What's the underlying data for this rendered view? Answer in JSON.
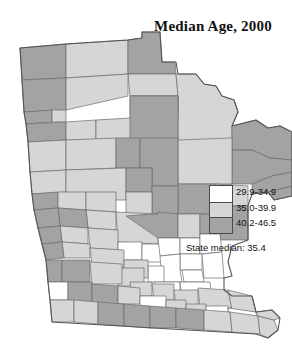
{
  "title": "Median Age, 2000",
  "legend": {
    "classes": [
      {
        "label": "29.9-34.9",
        "color": "#ffffff"
      },
      {
        "label": "35.0-39.9",
        "color": "#d6d6d6"
      },
      {
        "label": "40.2-46.5",
        "color": "#a3a3a3"
      }
    ],
    "state_median": "State median: 35.4"
  },
  "map": {
    "region": "Minnesota",
    "stroke": "#6b6b6b",
    "outline_stroke": "#555555",
    "counties": [
      {
        "name": "kittson",
        "cls": 2,
        "d": "M20,48 L66,44 L66,78 L22,80 Z"
      },
      {
        "name": "roseau",
        "cls": 1,
        "d": "M66,44 L128,40 L128,74 L66,78 Z"
      },
      {
        "name": "lake-of-the-woods",
        "cls": 2,
        "d": "M128,40 L142,38 L142,32 L160,32 L162,62 L175,62 L176,74 L128,74 Z"
      },
      {
        "name": "marshall",
        "cls": 2,
        "d": "M22,80 L66,78 L66,110 L24,112 Z"
      },
      {
        "name": "beltrami-north",
        "cls": 1,
        "d": "M128,74 L176,74 L178,96 L130,96 Z"
      },
      {
        "name": "pennington",
        "cls": 2,
        "d": "M24,112 L52,110 L52,122 L26,124 Z"
      },
      {
        "name": "red-lake",
        "cls": 1,
        "d": "M52,110 L66,110 L66,122 L52,122 Z"
      },
      {
        "name": "polk",
        "cls": 1,
        "d": "M66,78 L128,74 L128,96 L66,110 Z"
      },
      {
        "name": "koochiching",
        "cls": 1,
        "d": "M176,74 L196,74 L204,84 L216,86 L222,96 L234,100 L238,112 L232,126 L232,184 L178,184 L178,96 Z"
      },
      {
        "name": "st-louis-upper",
        "cls": 2,
        "d": "M232,126 L256,120 L268,128 L280,126 L292,132 L292,160 L270,158 L252,150 L232,150 Z"
      },
      {
        "name": "st-louis-lower",
        "cls": 2,
        "d": "M232,150 L252,150 L270,158 L292,160 L292,172 L272,176 L252,184 L232,184 Z"
      },
      {
        "name": "lake-county",
        "cls": 2,
        "d": "M252,184 L272,176 L292,172 L292,186 L268,192 L252,194 Z"
      },
      {
        "name": "cook-county",
        "cls": 2,
        "d": "M268,192 L292,186 L292,196 L274,200 Z"
      },
      {
        "name": "norman",
        "cls": 2,
        "d": "M26,124 L66,122 L66,140 L28,142 Z"
      },
      {
        "name": "mahnomen",
        "cls": 1,
        "d": "M66,122 L96,120 L96,140 L66,140 Z"
      },
      {
        "name": "clearwater",
        "cls": 1,
        "d": "M96,120 L130,118 L130,96 L178,96 L178,118 L130,140 L96,140 Z"
      },
      {
        "name": "beltrami-south",
        "cls": 2,
        "d": "M130,96 L178,96 L178,140 L130,140 Z"
      },
      {
        "name": "itasca",
        "cls": 1,
        "d": "M178,140 L232,138 L232,184 L178,184 Z"
      },
      {
        "name": "clay",
        "cls": 1,
        "d": "M28,142 L66,140 L66,170 L30,172 Z"
      },
      {
        "name": "becker",
        "cls": 1,
        "d": "M66,140 L116,138 L116,168 L66,170 Z"
      },
      {
        "name": "hubbard",
        "cls": 2,
        "d": "M116,138 L140,138 L140,168 L116,168 Z"
      },
      {
        "name": "cass",
        "cls": 2,
        "d": "M140,138 L178,138 L178,186 L152,186 L152,168 L140,168 Z"
      },
      {
        "name": "aitkin",
        "cls": 2,
        "d": "M178,184 L216,184 L216,214 L178,214 Z"
      },
      {
        "name": "carlton",
        "cls": 1,
        "d": "M216,184 L248,186 L248,206 L216,206 Z"
      },
      {
        "name": "wilkin",
        "cls": 1,
        "d": "M30,172 L66,170 L66,192 L32,194 Z"
      },
      {
        "name": "otter-tail",
        "cls": 1,
        "d": "M66,170 L126,168 L126,200 L66,200 Z"
      },
      {
        "name": "wadena",
        "cls": 2,
        "d": "M126,168 L152,168 L152,192 L126,192 Z"
      },
      {
        "name": "crow-wing",
        "cls": 2,
        "d": "M152,186 L178,186 L178,214 L152,214 Z"
      },
      {
        "name": "todd",
        "cls": 1,
        "d": "M126,192 L152,192 L152,216 L126,216 Z"
      },
      {
        "name": "traverse",
        "cls": 2,
        "d": "M32,194 L58,192 L58,208 L34,210 Z"
      },
      {
        "name": "grant",
        "cls": 1,
        "d": "M58,192 L86,192 L86,210 L58,208 Z"
      },
      {
        "name": "douglas",
        "cls": 1,
        "d": "M86,192 L116,192 L116,212 L86,210 Z"
      },
      {
        "name": "pope",
        "cls": 1,
        "d": "M86,210 L116,212 L116,230 L88,228 Z"
      },
      {
        "name": "stevens",
        "cls": 2,
        "d": "M58,208 L86,210 L88,228 L60,226 Z"
      },
      {
        "name": "big-stone",
        "cls": 2,
        "d": "M34,210 L58,208 L60,226 L38,228 Z"
      },
      {
        "name": "stearns",
        "cls": 1,
        "d": "M116,212 L158,214 L158,244 L118,242 Z"
      },
      {
        "name": "morrison",
        "cls": 2,
        "d": "M126,216 L152,214 L158,214 L158,212 L178,214 L178,238 L158,238 Z"
      },
      {
        "name": "mille-lacs",
        "cls": 1,
        "d": "M178,214 L200,214 L200,238 L178,238 Z"
      },
      {
        "name": "kanabec",
        "cls": 2,
        "d": "M200,214 L220,214 L220,234 L200,234 Z"
      },
      {
        "name": "pine",
        "cls": 2,
        "d": "M220,206 L248,206 L248,240 L220,240 Z"
      },
      {
        "name": "swift",
        "cls": 1,
        "d": "M60,226 L88,228 L88,244 L62,242 Z"
      },
      {
        "name": "lac-qui-parle",
        "cls": 2,
        "d": "M38,228 L60,226 L62,242 L42,244 Z"
      },
      {
        "name": "kandiyohi",
        "cls": 1,
        "d": "M88,228 L118,230 L118,250 L90,248 Z"
      },
      {
        "name": "meeker",
        "cls": 0,
        "d": "M118,242 L142,242 L142,260 L118,260 Z"
      },
      {
        "name": "wright",
        "cls": 0,
        "d": "M142,244 L170,244 L172,262 L142,262 Z"
      },
      {
        "name": "sherburne",
        "cls": 0,
        "d": "M158,238 L180,238 L180,254 L160,256 Z"
      },
      {
        "name": "isanti",
        "cls": 0,
        "d": "M180,238 L200,238 L200,254 L180,254 Z"
      },
      {
        "name": "chisago",
        "cls": 0,
        "d": "M200,234 L220,234 L222,252 L200,254 Z"
      },
      {
        "name": "anoka",
        "cls": 0,
        "d": "M180,254 L202,254 L202,270 L180,270 Z"
      },
      {
        "name": "washington",
        "cls": 0,
        "d": "M202,254 L222,252 L224,278 L204,278 Z"
      },
      {
        "name": "hennepin",
        "cls": 0,
        "d": "M160,256 L180,254 L180,270 L182,282 L162,282 Z"
      },
      {
        "name": "ramsey",
        "cls": 0,
        "d": "M182,270 L202,270 L204,282 L184,282 Z"
      },
      {
        "name": "carver",
        "cls": 0,
        "d": "M148,266 L164,266 L164,282 L148,282 Z"
      },
      {
        "name": "scott",
        "cls": 0,
        "d": "M154,282 L180,282 L180,296 L156,296 Z"
      },
      {
        "name": "dakota",
        "cls": 0,
        "d": "M180,282 L210,282 L212,300 L182,300 Z"
      },
      {
        "name": "chippewa",
        "cls": 1,
        "d": "M62,242 L90,244 L90,258 L64,258 Z"
      },
      {
        "name": "yellow-medicine",
        "cls": 2,
        "d": "M42,244 L62,242 L64,258 L46,260 Z"
      },
      {
        "name": "renville",
        "cls": 1,
        "d": "M90,248 L124,250 L124,268 L92,266 Z"
      },
      {
        "name": "mcleod",
        "cls": 1,
        "d": "M124,260 L148,260 L148,278 L124,278 Z"
      },
      {
        "name": "sibley",
        "cls": 1,
        "d": "M116,268 L144,268 L144,286 L118,286 Z"
      },
      {
        "name": "lincoln",
        "cls": 2,
        "d": "M46,260 L62,260 L62,282 L48,282 Z"
      },
      {
        "name": "lyon",
        "cls": 2,
        "d": "M62,260 L90,260 L90,282 L62,282 Z"
      },
      {
        "name": "redwood",
        "cls": 1,
        "d": "M90,262 L122,264 L122,284 L92,284 Z"
      },
      {
        "name": "nicollet",
        "cls": 1,
        "d": "M130,282 L152,282 L152,296 L132,296 Z"
      },
      {
        "name": "le-sueur",
        "cls": 1,
        "d": "M152,284 L174,284 L174,300 L154,300 Z"
      },
      {
        "name": "rice",
        "cls": 1,
        "d": "M174,290 L198,290 L198,306 L176,306 Z"
      },
      {
        "name": "goodhue",
        "cls": 1,
        "d": "M198,288 L228,290 L232,308 L200,308 Z"
      },
      {
        "name": "wabasha",
        "cls": 1,
        "d": "M228,290 L252,296 L256,312 L232,310 Z"
      },
      {
        "name": "pipestone",
        "cls": 0,
        "d": "M48,282 L68,282 L68,300 L50,300 Z"
      },
      {
        "name": "murray",
        "cls": 2,
        "d": "M68,282 L92,282 L92,302 L68,302 Z"
      },
      {
        "name": "cottonwood",
        "cls": 2,
        "d": "M92,284 L118,286 L118,304 L92,304 Z"
      },
      {
        "name": "brown",
        "cls": 1,
        "d": "M118,286 L140,288 L140,304 L118,304 Z"
      },
      {
        "name": "blue-earth",
        "cls": 0,
        "d": "M140,296 L166,296 L166,312 L140,312 Z"
      },
      {
        "name": "waseca",
        "cls": 1,
        "d": "M166,300 L186,300 L186,314 L166,314 Z"
      },
      {
        "name": "steele",
        "cls": 1,
        "d": "M186,304 L206,304 L206,318 L186,318 Z"
      },
      {
        "name": "dodge",
        "cls": 0,
        "d": "M206,306 L228,306 L228,320 L206,320 Z"
      },
      {
        "name": "olmsted",
        "cls": 0,
        "d": "M228,308 L256,312 L258,324 L230,322 Z"
      },
      {
        "name": "rock",
        "cls": 1,
        "d": "M50,300 L74,300 L74,322 L52,322 Z"
      },
      {
        "name": "nobles",
        "cls": 1,
        "d": "M74,300 L98,302 L98,324 L74,322 Z"
      },
      {
        "name": "jackson",
        "cls": 2,
        "d": "M98,302 L124,304 L124,326 L98,324 Z"
      },
      {
        "name": "martin",
        "cls": 2,
        "d": "M124,304 L150,306 L150,328 L124,326 Z"
      },
      {
        "name": "faribault",
        "cls": 2,
        "d": "M150,306 L176,308 L176,328 L150,328 Z"
      },
      {
        "name": "freeborn",
        "cls": 2,
        "d": "M176,308 L204,310 L204,330 L176,328 Z"
      },
      {
        "name": "mower",
        "cls": 1,
        "d": "M204,310 L230,312 L232,332 L204,330 Z"
      },
      {
        "name": "fillmore",
        "cls": 1,
        "d": "M230,312 L258,316 L260,334 L232,332 Z"
      },
      {
        "name": "houston",
        "cls": 1,
        "d": "M258,316 L274,320 L278,330 L268,338 L260,334 Z"
      },
      {
        "name": "winona",
        "cls": 1,
        "d": "M256,312 L272,310 L280,318 L274,320 L258,316 Z"
      }
    ],
    "outline": "M20,48 L66,44 L128,40 L142,38 L142,32 L160,32 L162,62 L176,62 L178,74 L196,74 L204,84 L216,86 L222,96 L234,100 L238,112 L232,126 L256,120 L268,128 L280,126 L292,132 L292,196 L274,200 L268,192 L252,194 L248,206 L248,240 L232,246 L228,262 L232,276 L224,278 L224,290 L232,296 L252,296 L256,312 L272,310 L280,318 L278,330 L268,338 L256,334 L52,322 L50,300 L48,282 L46,260 L42,244 L38,228 L34,210 L32,194 L30,172 L28,142 L26,124 L24,112 L22,80 Z"
  }
}
